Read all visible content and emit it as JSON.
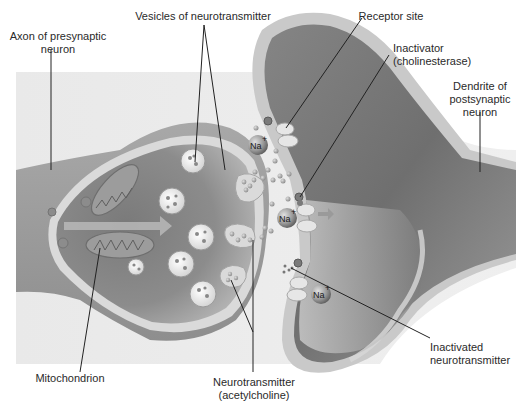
{
  "diagram": {
    "colors": {
      "background_panel": "#e8e8e8",
      "axon_body": "#9a9a9a",
      "axon_membrane": "#d8d8d8",
      "axon_cytoplasm_dark": "#6a6a6a",
      "dendrite_body": "#7a7a7a",
      "dendrite_membrane": "#c4c4c4",
      "vesicle": "#f2f2f2",
      "ion": "#8a8a8a",
      "label_text": "#2a2a2a",
      "leader_line": "#222222"
    },
    "labels": {
      "axon": {
        "line1": "Axon of presynaptic",
        "line2": "neuron"
      },
      "vesicles": "Vesicles of neurotransmitter",
      "receptor": "Receptor site",
      "inactivator": {
        "line1": "Inactivator",
        "line2": "(cholinesterase)"
      },
      "dendrite": {
        "line1": "Dendrite of",
        "line2": "postsynaptic",
        "line3": "neuron"
      },
      "mitochondrion": "Mitochondrion",
      "neurotransmitter": {
        "line1": "Neurotransmitter",
        "line2": "(acetylcholine)"
      },
      "inactivated": {
        "line1": "Inactivated",
        "line2": "neurotransmitter"
      }
    },
    "ions": [
      {
        "symbol": "Na",
        "charge": "+"
      },
      {
        "symbol": "Na",
        "charge": "+"
      },
      {
        "symbol": "Na",
        "charge": "+"
      }
    ]
  }
}
